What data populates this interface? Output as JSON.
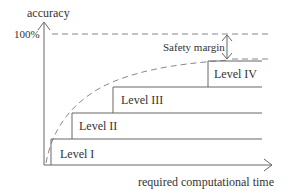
{
  "axes": {
    "y_label": "accuracy",
    "x_label": "required computational time",
    "y_tick_100": "100%"
  },
  "annotations": {
    "safety_margin": "Safety margin"
  },
  "levels": [
    {
      "label": "Level I"
    },
    {
      "label": "Level II"
    },
    {
      "label": "Level III"
    },
    {
      "label": "Level IV"
    }
  ],
  "colors": {
    "line": "#666666",
    "dash": "#888888",
    "text": "#333333"
  }
}
